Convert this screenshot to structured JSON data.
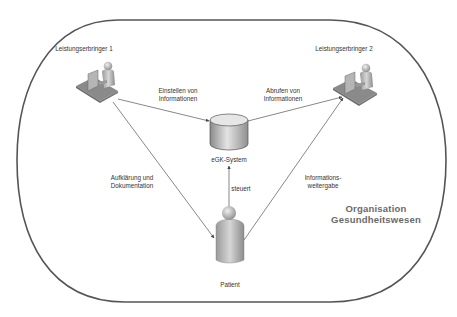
{
  "diagram": {
    "type": "information-flow",
    "boundary": {
      "label_line1": "Organisation",
      "label_line2": "Gesundheitswesen",
      "stroke_color": "#555555"
    },
    "nodes": [
      {
        "id": "provider1",
        "label": "Leistungserbringer 1",
        "icon": "person-at-computer-icon"
      },
      {
        "id": "provider2",
        "label": "Leistungserbringer 2",
        "icon": "person-at-computer-icon"
      },
      {
        "id": "egk",
        "label": "eGK-System",
        "icon": "database-cylinder-icon"
      },
      {
        "id": "patient",
        "label": "Patient",
        "icon": "person-icon"
      }
    ],
    "edges": [
      {
        "from": "provider1",
        "to": "egk",
        "label_line1": "Einstellen von",
        "label_line2": "Informationen"
      },
      {
        "from": "egk",
        "to": "provider2",
        "label_line1": "Abrufen von",
        "label_line2": "Informationen"
      },
      {
        "from": "provider1",
        "to": "patient",
        "label_line1": "Aufklärung und",
        "label_line2": "Dokumentation"
      },
      {
        "from": "patient",
        "to": "egk",
        "label_line1": "steuert",
        "label_line2": ""
      },
      {
        "from": "patient",
        "to": "provider2",
        "label_line1": "Informations-",
        "label_line2": "weitergabe"
      }
    ],
    "colors": {
      "line": "#555555",
      "icon_fill": "#a8a8a8",
      "icon_dark": "#6e6e6e",
      "icon_light": "#d9d9d9",
      "text": "#333333",
      "org_text": "#6a6a6a"
    }
  }
}
